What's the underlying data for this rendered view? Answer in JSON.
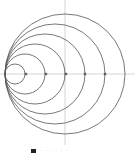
{
  "diagram": {
    "type": "nested-tangent-circles",
    "tangent_point": {
      "x": 5,
      "y": 74
    },
    "circle_radii": [
      10,
      20,
      30,
      40,
      50,
      60
    ],
    "stroke_color": "#555555",
    "axis_color": "#bbbbbb",
    "horizontal_axis_y": 74,
    "vertical_axis_x": 65,
    "markers_on_axis_x": [
      26,
      46,
      66,
      85,
      105
    ]
  },
  "legend": {
    "swatch_color": "#222222",
    "label": "· · ·  · · ·"
  }
}
